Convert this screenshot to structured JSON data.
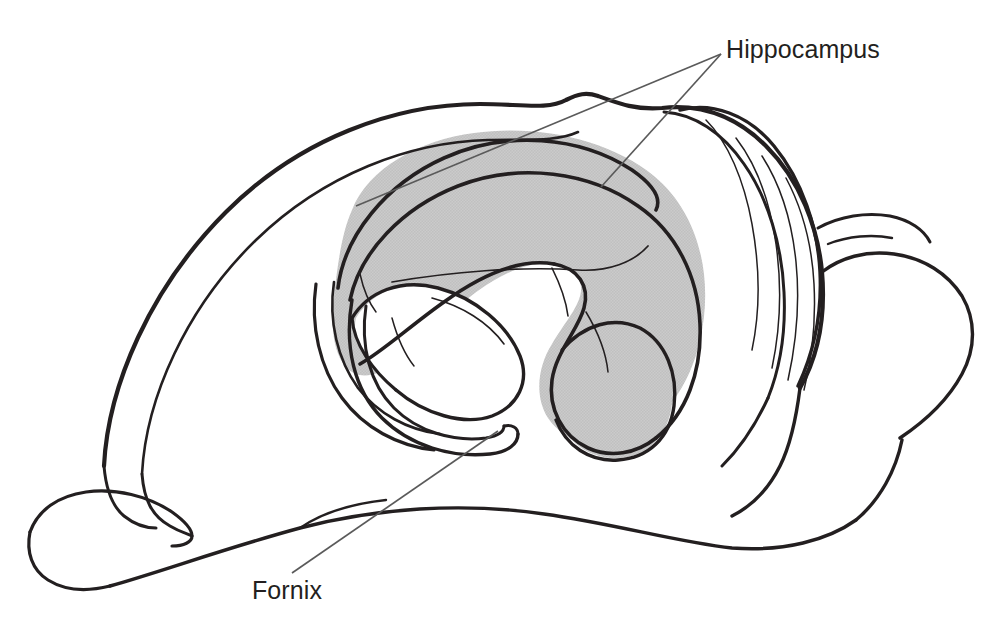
{
  "figure": {
    "title_visible": false,
    "background_color": "#ffffff",
    "line_color": "#231f20",
    "shading_color": "#c8c8c8",
    "shading_edge_color": "#b8b8b8"
  },
  "labels": [
    {
      "id": "hippocampus",
      "text": "Hippocampus",
      "x": 726,
      "y": 58,
      "anchor": "start",
      "font_size": 25,
      "color": "#231f20",
      "leader_lines": [
        {
          "x1": 721,
          "y1": 54,
          "x2": 356,
          "y2": 206
        },
        {
          "x1": 721,
          "y1": 54,
          "x2": 601,
          "y2": 187
        }
      ]
    },
    {
      "id": "fornix",
      "text": "Fornix",
      "x": 252,
      "y": 599,
      "anchor": "start",
      "font_size": 25,
      "color": "#231f20",
      "leader_lines": [
        {
          "x1": 292,
          "y1": 573,
          "x2": 498,
          "y2": 431
        }
      ]
    }
  ],
  "structures": [
    {
      "id": "cerebral-cortex-outline",
      "name": "cerebral cortex outline",
      "filled": false
    },
    {
      "id": "frontal-lobe",
      "name": "frontal lobe",
      "filled": false
    },
    {
      "id": "olfactory-bulb",
      "name": "olfactory bulb",
      "filled": false
    },
    {
      "id": "cerebellum",
      "name": "cerebellum with folia",
      "filled": false
    },
    {
      "id": "brainstem",
      "name": "brainstem",
      "filled": false
    },
    {
      "id": "hippocampus-body",
      "name": "hippocampus",
      "filled": true,
      "fill": "#c8c8c8"
    },
    {
      "id": "fornix-arc",
      "name": "fornix",
      "filled": false
    },
    {
      "id": "lateral-ventricle",
      "name": "lateral ventricle",
      "filled": false
    }
  ]
}
